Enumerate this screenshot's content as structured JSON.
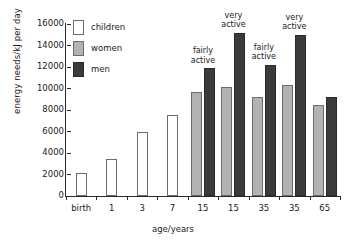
{
  "chart_data": {
    "type": "bar",
    "title": "",
    "xlabel": "age/years",
    "ylabel": "energy needs/kJ per day",
    "ylim": [
      0,
      16000
    ],
    "ytick_step": 2000,
    "yticks": [
      "0",
      "2000",
      "4000",
      "6000",
      "8000",
      "10000",
      "12000",
      "14000",
      "16000"
    ],
    "grid": false,
    "legend_position": "top-left",
    "categories": [
      "birth",
      "1",
      "3",
      "7",
      "15",
      "15",
      "35",
      "35",
      "65"
    ],
    "series": [
      {
        "name": "children",
        "color": "#ffffff",
        "values": [
          2100,
          3400,
          6000,
          7500,
          null,
          null,
          null,
          null,
          null
        ]
      },
      {
        "name": "women",
        "color": "#b2b2b2",
        "values": [
          null,
          null,
          null,
          null,
          9700,
          10100,
          9200,
          10300,
          8500
        ]
      },
      {
        "name": "men",
        "color": "#3b3b3b",
        "values": [
          null,
          null,
          null,
          null,
          11900,
          15200,
          12200,
          15000,
          9200
        ]
      }
    ],
    "annotations": [
      {
        "text": "fairly active",
        "group": 4,
        "lines": [
          "fairly",
          "active"
        ]
      },
      {
        "text": "very active",
        "group": 5,
        "lines": [
          "very",
          "active"
        ]
      },
      {
        "text": "fairly active",
        "group": 6,
        "lines": [
          "fairly",
          "active"
        ]
      },
      {
        "text": "very active",
        "group": 7,
        "lines": [
          "very",
          "active"
        ]
      }
    ]
  },
  "legend": {
    "items": [
      {
        "label": "children",
        "key": "children"
      },
      {
        "label": "women",
        "key": "women"
      },
      {
        "label": "men",
        "key": "men"
      }
    ]
  },
  "axes": {
    "y_title": "energy needs/kJ per day",
    "x_title": "age/years"
  }
}
